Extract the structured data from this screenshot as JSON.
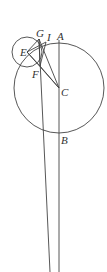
{
  "diagram": {
    "points": {
      "A": {
        "label": "A"
      },
      "B": {
        "label": "B"
      },
      "C": {
        "label": "C"
      },
      "E": {
        "label": "E"
      },
      "F": {
        "label": "F"
      },
      "G": {
        "label": "G"
      },
      "I": {
        "label": "I"
      }
    },
    "circles": [
      {
        "name": "large-circle",
        "center": "C"
      },
      {
        "name": "small-circle",
        "center": "E"
      }
    ],
    "segments": [
      [
        "A",
        "B"
      ],
      [
        "E",
        "F"
      ],
      [
        "E",
        "I"
      ],
      [
        "G",
        "F"
      ],
      [
        "G",
        "C"
      ],
      [
        "F",
        "C"
      ],
      [
        "I",
        "C"
      ],
      [
        "E",
        "C"
      ]
    ],
    "colors": {
      "ink": "#444444",
      "background": "#ffffff"
    }
  }
}
